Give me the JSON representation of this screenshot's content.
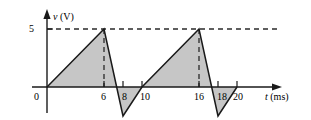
{
  "figure": {
    "background_color": "#ffffff",
    "line_color": "#1a1a1a",
    "fill_color": "#c6c6c6",
    "dash_color": "#2a2a2a"
  },
  "chart_data": {
    "type": "line",
    "title": "",
    "xlabel_symbol": "t",
    "xlabel_unit": "(ms)",
    "ylabel_symbol": "v",
    "ylabel_unit": "(V)",
    "xlabel": "t (ms)",
    "ylabel": "v (V)",
    "grid": false,
    "legend": null,
    "xlim": [
      0,
      20.5
    ],
    "ylim": [
      -2.5,
      5.5
    ],
    "x_ticks": [
      0,
      6,
      8,
      10,
      16,
      18,
      20
    ],
    "x_tick_labels": [
      "0",
      "6",
      "8",
      "10",
      "16",
      "18",
      "20"
    ],
    "y_ticks": [
      5
    ],
    "y_tick_labels": [
      "5"
    ],
    "annotations": [
      {
        "name": "peak-dashed-level",
        "type": "hline",
        "value": 5
      },
      {
        "name": "peak-1-dropline",
        "type": "vline",
        "value": 6
      },
      {
        "name": "peak-2-dropline",
        "type": "vline",
        "value": 16
      }
    ],
    "series": [
      {
        "name": "v(t)",
        "fill": true,
        "x": [
          0,
          6,
          8,
          10,
          16,
          18,
          20
        ],
        "y": [
          0,
          5,
          -2.5,
          0,
          5,
          -2.5,
          0
        ]
      }
    ]
  },
  "axes": {
    "y_axis_name": "voltage-axis",
    "x_axis_name": "time-axis",
    "y_tick_5": "5",
    "x_tick_0": "0",
    "x_tick_6": "6",
    "x_tick_8": "8",
    "x_tick_10": "10",
    "x_tick_16": "16",
    "x_tick_18": "18",
    "x_tick_20": "20",
    "x_axis_symbol": "t",
    "x_axis_unit": "(ms)",
    "y_axis_symbol": "v",
    "y_axis_unit": "(V)"
  }
}
